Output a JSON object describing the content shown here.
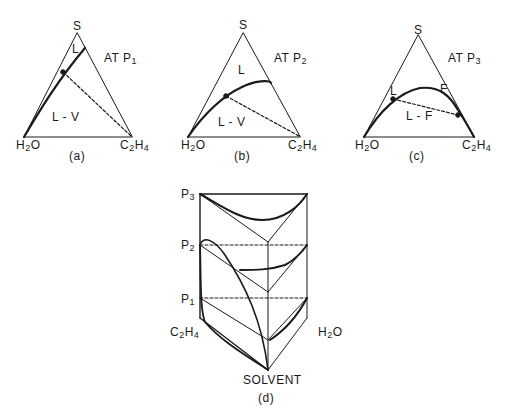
{
  "panels": [
    {
      "id": "a",
      "caption": "(a)",
      "pressure_label": "AT P",
      "pressure_sub": "1",
      "vertex_top": "S",
      "vertex_left": {
        "base": "H",
        "sub": "2",
        "rest": "O"
      },
      "vertex_right": {
        "base": "C",
        "sub": "2",
        "mid": "H",
        "sub2": "4"
      },
      "regions": [
        "L",
        "L - V"
      ]
    },
    {
      "id": "b",
      "caption": "(b)",
      "pressure_label": "AT P",
      "pressure_sub": "2",
      "vertex_top": "S",
      "vertex_left": {
        "base": "H",
        "sub": "2",
        "rest": "O"
      },
      "vertex_right": {
        "base": "C",
        "sub": "2",
        "mid": "H",
        "sub2": "4"
      },
      "regions": [
        "L",
        "L - V"
      ]
    },
    {
      "id": "c",
      "caption": "(c)",
      "pressure_label": "AT P",
      "pressure_sub": "3",
      "vertex_top": "S",
      "vertex_left": {
        "base": "H",
        "sub": "2",
        "rest": "O"
      },
      "vertex_right": {
        "base": "C",
        "sub": "2",
        "mid": "H",
        "sub2": "4"
      },
      "regions": [
        "L",
        "F",
        "L - F"
      ]
    }
  ],
  "prism": {
    "caption": "(d)",
    "pressure_levels": [
      {
        "base": "P",
        "sub": "3"
      },
      {
        "base": "P",
        "sub": "2"
      },
      {
        "base": "P",
        "sub": "1"
      }
    ],
    "left_label": {
      "base": "C",
      "sub": "2",
      "mid": "H",
      "sub2": "4"
    },
    "right_label": {
      "base": "H",
      "sub": "2",
      "rest": "O"
    },
    "bottom_label": "SOLVENT"
  }
}
